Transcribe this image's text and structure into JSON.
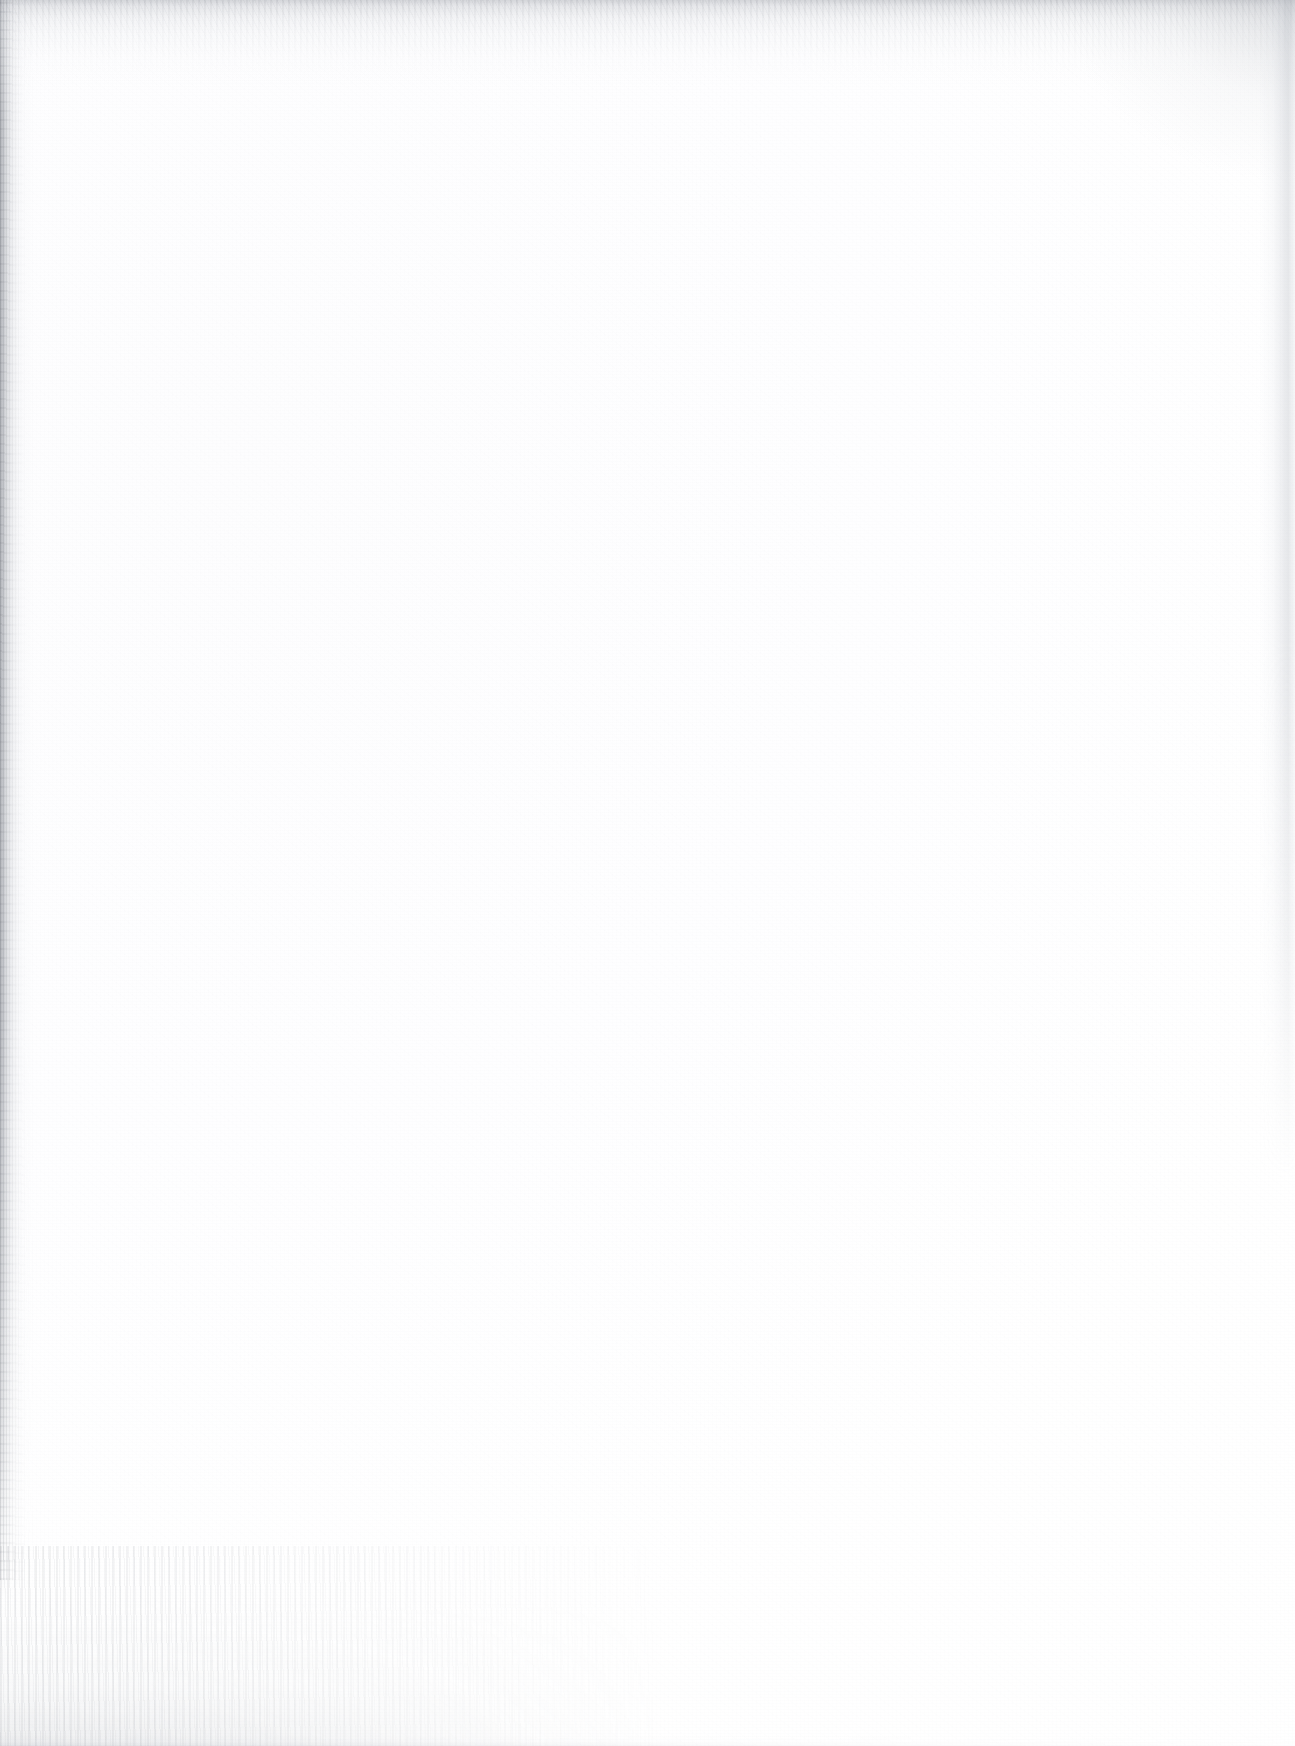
{
  "document": {
    "page_kind": "blank-scanned-page",
    "page_text": "",
    "header_text": "",
    "footer_text": "",
    "page_number": "",
    "marginalia": ""
  },
  "scan": {
    "background_color": "#ffffff",
    "paper_tone": "#fdfdfe",
    "edge_shadow_color": "#808c94",
    "grain_color": "#787d87",
    "artifacts": [
      {
        "name": "top-edge-shadow",
        "description": "speckled grey gradient band along the top edge",
        "color": "#969aa2"
      },
      {
        "name": "left-edge-shadow",
        "description": "narrow dark vertical binding-gutter band on the left margin",
        "color": "#80848c"
      },
      {
        "name": "right-paper-edge",
        "description": "faint vertical paper edge line near the right margin, upper half only",
        "color": "#b6bac2"
      },
      {
        "name": "top-right-corner-shade",
        "description": "soft darkening in the top-right corner",
        "color": "#969aa2"
      },
      {
        "name": "bottom-left-streak",
        "description": "faint grey scanner streak/smudge texture at the bottom-left",
        "color": "#8a8e96"
      }
    ]
  }
}
